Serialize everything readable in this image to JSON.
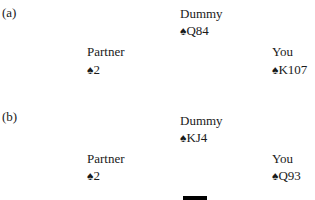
{
  "diagrams": [
    {
      "label": "(a)",
      "dummy": {
        "name": "Dummy",
        "suit": "♠",
        "cards": "Q84"
      },
      "partner": {
        "name": "Partner",
        "suit": "♠",
        "cards": "2"
      },
      "you": {
        "name": "You",
        "suit": "♠",
        "cards": "K107"
      }
    },
    {
      "label": "(b)",
      "dummy": {
        "name": "Dummy",
        "suit": "♠",
        "cards": "KJ4"
      },
      "partner": {
        "name": "Partner",
        "suit": "♠",
        "cards": "2"
      },
      "you": {
        "name": "You",
        "suit": "♠",
        "cards": "Q93"
      }
    }
  ]
}
